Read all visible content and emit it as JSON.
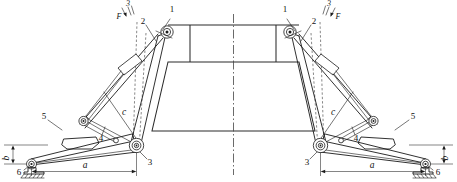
{
  "figure": {
    "background_color": "#ffffff",
    "line_color": "#1a1a1a",
    "width": 457,
    "height": 182
  },
  "callouts": {
    "left": [
      {
        "id": "1",
        "label": "1"
      },
      {
        "id": "2",
        "label": "2"
      },
      {
        "id": "3",
        "label": "3"
      },
      {
        "id": "4",
        "label": "4"
      },
      {
        "id": "5",
        "label": "5"
      },
      {
        "id": "6",
        "label": "6"
      }
    ],
    "right": [
      {
        "id": "1",
        "label": "1"
      },
      {
        "id": "2",
        "label": "2"
      },
      {
        "id": "3",
        "label": "3"
      },
      {
        "id": "4",
        "label": "4"
      },
      {
        "id": "5",
        "label": "5"
      },
      {
        "id": "6",
        "label": "6"
      }
    ]
  },
  "dimensions": {
    "left": {
      "horizontal": "a",
      "vertical": "b",
      "diagonal": "c"
    },
    "right": {
      "horizontal": "a",
      "vertical": "b",
      "diagonal": "c"
    }
  },
  "force_labels": {
    "left": {
      "symbol": "F",
      "index": "3"
    },
    "right": {
      "symbol": "F",
      "index": "3"
    }
  }
}
